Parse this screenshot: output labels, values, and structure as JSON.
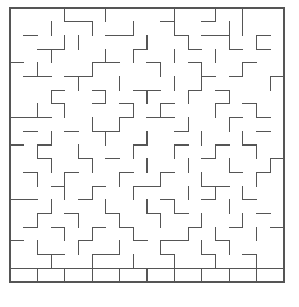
{
  "figure": {
    "kind": "maze-grid",
    "background_color": "#ffffff",
    "wall_color": "#555555",
    "border_color": "#555555"
  },
  "maze": {
    "columns": 20,
    "rows": 20,
    "cell_size": 13.7,
    "origin_x": 10,
    "origin_y": 8,
    "wall_thickness": 1.15,
    "border_thickness": 1.3,
    "horizontal_walls": [
      "00111111111011111111",
      "00001100000100100000",
      "01000001100010110010",
      "00110000010001001010",
      "10000011001001000100",
      "01101100000000101001",
      "00010010011001010000",
      "00010010100100010100",
      "11100000101100001010",
      "01001011000010000010",
      "10100000010010010100",
      "00100101000000100001",
      "01001000100100001010",
      "00010010011000110000",
      "11000100000100100100",
      "00101001001010000010",
      "01010010100001001001",
      "10000100010110010000",
      "00110011000100100100",
      "11111111111111111111"
    ],
    "vertical_walls": [
      "100010010000100101001",
      "100100100100100011001",
      "100011000010010010101",
      "100100010100100100001",
      "101000100001001001001",
      "100001001000101000011",
      "100100010010010010001",
      "101010000101000100101",
      "100000101000010010001",
      "100100010010001001001",
      "101001000100100100101",
      "100100100010010010011",
      "101010001001001000101",
      "100010100100010101001",
      "100100010010100010001",
      "101001001001001001001",
      "100010100100010100101",
      "101001001001001010001",
      "100100100100100100101",
      "101010101010101010101"
    ]
  }
}
